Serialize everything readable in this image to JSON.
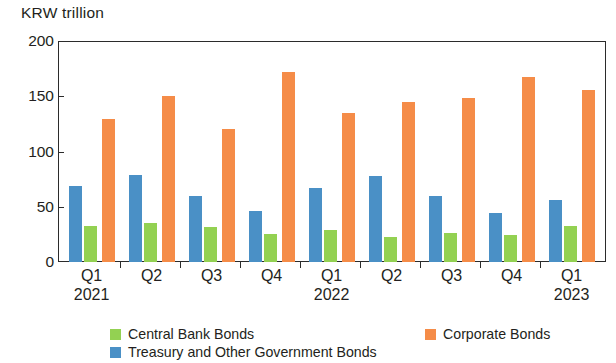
{
  "chart_data": {
    "type": "bar",
    "title": "",
    "subtitle": "",
    "unit_label": "KRW trillion",
    "xlabel": "",
    "ylabel": "KRW trillion",
    "ylim": [
      0,
      200
    ],
    "yticks": [
      0,
      50,
      100,
      150,
      200
    ],
    "grid": false,
    "legend_position": "bottom",
    "categories": [
      "Q1",
      "Q2",
      "Q3",
      "Q4",
      "Q1",
      "Q2",
      "Q3",
      "Q4",
      "Q1"
    ],
    "category_years": [
      "2021",
      "",
      "",
      "",
      "2022",
      "",
      "",
      "",
      "2023"
    ],
    "series": [
      {
        "name": "Treasury and Other Government Bonds",
        "color": "#4a90c6",
        "values": [
          69,
          79,
          60,
          46,
          67,
          78,
          60,
          44,
          56
        ]
      },
      {
        "name": "Central Bank Bonds",
        "color": "#93d152",
        "values": [
          33,
          35,
          32,
          25,
          29,
          23,
          26,
          24,
          33
        ]
      },
      {
        "name": "Corporate Bonds",
        "color": "#f58c48",
        "values": [
          129,
          150,
          120,
          172,
          135,
          145,
          148,
          167,
          156
        ]
      }
    ]
  },
  "axis": {
    "unit_label": "KRW trillion",
    "ytick_labels": [
      "200",
      "150",
      "100",
      "50",
      "0"
    ],
    "xtick_labels": [
      {
        "q": "Q1",
        "year": "2021"
      },
      {
        "q": "Q2",
        "year": ""
      },
      {
        "q": "Q3",
        "year": ""
      },
      {
        "q": "Q4",
        "year": ""
      },
      {
        "q": "Q1",
        "year": "2022"
      },
      {
        "q": "Q2",
        "year": ""
      },
      {
        "q": "Q3",
        "year": ""
      },
      {
        "q": "Q4",
        "year": ""
      },
      {
        "q": "Q1",
        "year": "2023"
      }
    ]
  },
  "legend": {
    "central": "Central Bank Bonds",
    "corporate": "Corporate Bonds",
    "treasury": "Treasury and Other Government Bonds"
  },
  "colors": {
    "central_bank_bonds": "#93d152",
    "corporate_bonds": "#f58c48",
    "treasury_bonds": "#4a90c6",
    "axis": "#2b2b2b",
    "text": "#231f20",
    "background": "#ffffff"
  }
}
